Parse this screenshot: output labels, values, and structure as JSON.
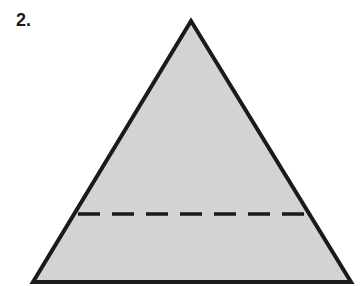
{
  "problem": {
    "number_label": "2."
  },
  "figure": {
    "shape": "triangle",
    "fill_color": "#d3d3d3",
    "stroke_color": "#1a1a1a",
    "apex": [
      191,
      21
    ],
    "base_left": [
      33,
      282
    ],
    "base_right": [
      351,
      282
    ],
    "dashed_line": {
      "y": 214,
      "x1": 78,
      "x2": 305,
      "style": "dashed"
    }
  }
}
